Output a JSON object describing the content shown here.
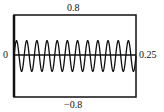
{
  "chart_data": {
    "type": "line",
    "title": "",
    "xlabel": "",
    "ylabel": "",
    "xlim": [
      0,
      0.25
    ],
    "ylim": [
      -0.8,
      0.8
    ],
    "grid": false,
    "legend": null,
    "tick_labels": {
      "y_top": "0.8",
      "y_bottom": "−0.8",
      "x_left": "0",
      "x_right": "0.25"
    },
    "series": [
      {
        "name": "signal",
        "function": "0.3*sin(2*pi*48*t)",
        "amplitude": 0.3,
        "cycles": 12,
        "frequency_hz": 48,
        "color": "#111111"
      }
    ],
    "zero_line": true
  }
}
